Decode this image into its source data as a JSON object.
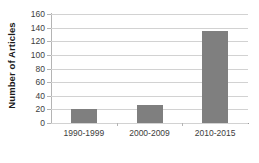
{
  "chart_data": {
    "type": "bar",
    "title": "",
    "xlabel": "",
    "ylabel": "Number of Articles",
    "categories": [
      "1990-1999",
      "2000-2009",
      "2010-2015"
    ],
    "values": [
      21,
      26,
      135
    ],
    "ylim": [
      0,
      160
    ],
    "y_ticks": [
      0,
      20,
      40,
      60,
      80,
      100,
      120,
      140,
      160
    ],
    "y_tick_labels": [
      "0",
      "20",
      "40",
      "60",
      "80",
      "100",
      "120",
      "140",
      "160"
    ],
    "grid": true,
    "legend": false,
    "legend_position": "none",
    "series": [
      {
        "name": "Number of Articles",
        "values": [
          21,
          26,
          135
        ],
        "color": "#7f7f7f"
      }
    ],
    "colors": {
      "bar": "#7f7f7f",
      "gridline": "#d2d2d2",
      "axis": "#9a9a9a",
      "text": "#3d3d3d",
      "axis_title": "#1a1a1a",
      "background": "#ffffff"
    }
  }
}
